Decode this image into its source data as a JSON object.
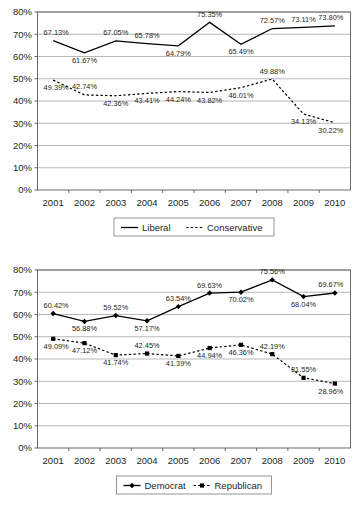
{
  "chart_data": [
    {
      "id": "top",
      "type": "line",
      "title": "",
      "xlabel": "",
      "ylabel": "",
      "ylim": [
        0,
        80
      ],
      "ytick_labels": [
        "0%",
        "10%",
        "20%",
        "30%",
        "40%",
        "50%",
        "60%",
        "70%",
        "80%"
      ],
      "yticks": [
        0,
        10,
        20,
        30,
        40,
        50,
        60,
        70,
        80
      ],
      "grid": true,
      "legend_position": "bottom",
      "categories": [
        "2001",
        "2002",
        "2003",
        "2004",
        "2005",
        "2006",
        "2007",
        "2008",
        "2009",
        "2010"
      ],
      "series": [
        {
          "name": "Liberal",
          "style": "solid",
          "marker": "none",
          "values": [
            67.13,
            61.67,
            67.05,
            65.78,
            64.79,
            75.35,
            65.49,
            72.57,
            73.11,
            73.8
          ],
          "labels": [
            "67.13%",
            "61.67%",
            "67.05%",
            "65.78%",
            "64.79%",
            "75.35%",
            "65.49%",
            "72.57%",
            "73.11%",
            "73.80%"
          ],
          "label_pos": [
            "above",
            "below",
            "above",
            "above",
            "below",
            "above",
            "below",
            "above",
            "above",
            "above"
          ]
        },
        {
          "name": "Conservative",
          "style": "dashed",
          "marker": "none",
          "values": [
            49.39,
            42.74,
            42.36,
            43.41,
            44.24,
            43.82,
            46.01,
            49.88,
            34.13,
            30.22
          ],
          "labels": [
            "49.39%",
            "42.74%",
            "42.36%",
            "43.41%",
            "44.24%",
            "43.82%",
            "46.01%",
            "49.88%",
            "34.13%",
            "30.22%"
          ],
          "label_pos": [
            "below",
            "above",
            "below",
            "below",
            "below",
            "below",
            "below",
            "above",
            "below",
            "below"
          ]
        }
      ]
    },
    {
      "id": "bottom",
      "type": "line",
      "title": "",
      "xlabel": "",
      "ylabel": "",
      "ylim": [
        0,
        80
      ],
      "ytick_labels": [
        "0%",
        "10%",
        "20%",
        "30%",
        "40%",
        "50%",
        "60%",
        "70%",
        "80%"
      ],
      "yticks": [
        0,
        10,
        20,
        30,
        40,
        50,
        60,
        70,
        80
      ],
      "grid": true,
      "legend_position": "bottom",
      "categories": [
        "2001",
        "2002",
        "2003",
        "2004",
        "2005",
        "2006",
        "2007",
        "2008",
        "2009",
        "2010"
      ],
      "series": [
        {
          "name": "Democrat",
          "style": "solid",
          "marker": "diamond",
          "values": [
            60.42,
            56.88,
            59.52,
            57.17,
            63.54,
            69.63,
            70.02,
            75.56,
            68.04,
            69.67
          ],
          "labels": [
            "60.42%",
            "56.88%",
            "59.52%",
            "57.17%",
            "63.54%",
            "69.63%",
            "70.02%",
            "75.56%",
            "68.04%",
            "69.67%"
          ],
          "label_pos": [
            "above",
            "below",
            "above",
            "below",
            "above",
            "above",
            "below",
            "above",
            "below",
            "above"
          ]
        },
        {
          "name": "Republican",
          "style": "dashed",
          "marker": "square",
          "values": [
            49.09,
            47.12,
            41.74,
            42.45,
            41.39,
            44.94,
            46.36,
            42.19,
            31.55,
            28.96
          ],
          "labels": [
            "49.09%",
            "47.12%",
            "41.74%",
            "42.45%",
            "41.39%",
            "44.94%",
            "46.36%",
            "42.19%",
            "31.55%",
            "28.96%"
          ],
          "label_pos": [
            "below",
            "below",
            "below",
            "above",
            "below",
            "below",
            "below",
            "above",
            "above",
            "below"
          ]
        }
      ]
    }
  ],
  "colors": {
    "series": "#000000",
    "grid": "#9a9a9a",
    "axis": "#595959",
    "text": "#231f20",
    "background": "#ffffff"
  }
}
